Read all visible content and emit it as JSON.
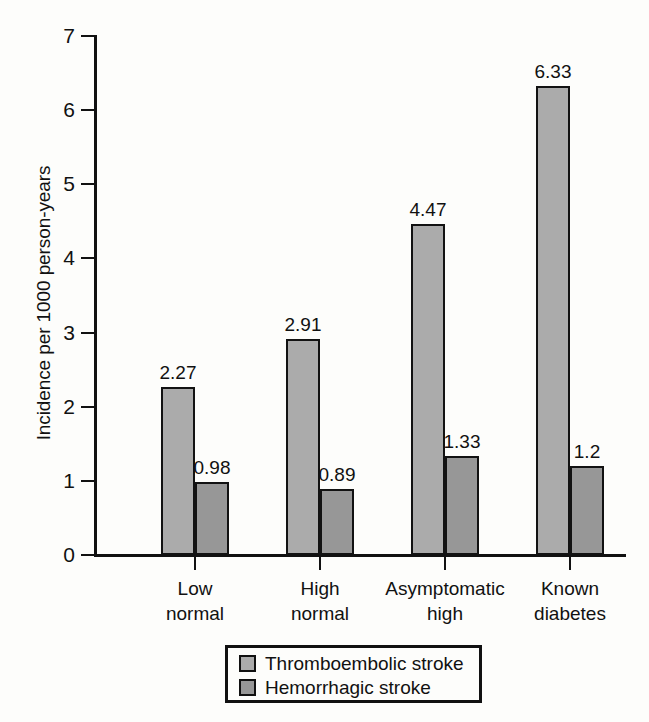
{
  "chart_data": {
    "type": "bar",
    "title": "",
    "xlabel": "",
    "ylabel": "Incidence per 1000 person-years",
    "ylim": [
      0,
      7
    ],
    "yticks": [
      "0",
      "1",
      "2",
      "3",
      "4",
      "5",
      "6",
      "7"
    ],
    "grid": false,
    "legend_position": "bottom",
    "categories": [
      [
        "Low",
        "normal"
      ],
      [
        "High",
        "normal"
      ],
      [
        "Asymptomatic",
        "high"
      ],
      [
        "Known",
        "diabetes"
      ]
    ],
    "category_labels": [
      "Low normal",
      "High normal",
      "Asymptomatic high",
      "Known diabetes"
    ],
    "series": [
      {
        "name": "Thromboembolic stroke",
        "color": "#ababab",
        "values": [
          2.27,
          2.91,
          4.47,
          6.33
        ],
        "value_labels": [
          "2.27",
          "2.91",
          "4.47",
          "6.33"
        ]
      },
      {
        "name": "Hemorrhagic stroke",
        "color": "#979797",
        "values": [
          0.98,
          0.89,
          1.33,
          1.2
        ],
        "value_labels": [
          "0.98",
          "0.89",
          "1.33",
          "1.2"
        ]
      }
    ]
  },
  "legend": {
    "items": [
      {
        "label": "Thromboembolic stroke"
      },
      {
        "label": "Hemorrhagic stroke"
      }
    ]
  },
  "axis": {
    "y_title": "Incidence per 1000 person-years"
  }
}
